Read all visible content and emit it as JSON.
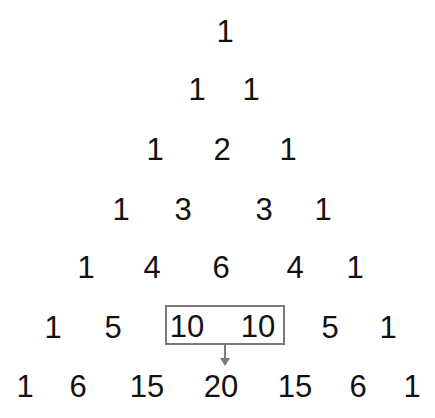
{
  "rows": [
    [
      "1"
    ],
    [
      "1",
      "1"
    ],
    [
      "1",
      "2",
      "1"
    ],
    [
      "1",
      "3",
      "3",
      "1"
    ],
    [
      "1",
      "4",
      "6",
      "4",
      "1"
    ],
    [
      "1",
      "5",
      "10",
      "10",
      "5",
      "1"
    ],
    [
      "1",
      "6",
      "15",
      "20",
      "15",
      "6",
      "1"
    ]
  ],
  "highlight": {
    "row": 5,
    "cells": [
      "10",
      "10"
    ],
    "result_row": 6,
    "result": "20",
    "box_color": "#7a7a7a",
    "arrow_color": "#7a7a7a"
  }
}
